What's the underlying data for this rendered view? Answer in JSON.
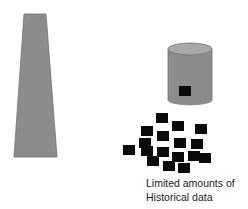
{
  "diagram": {
    "tower": {
      "label": "",
      "color": "#8c8c8c"
    },
    "cylinder": {
      "label": "",
      "body_color": "#8c8c8c",
      "top_color": "#a8a8a8"
    },
    "data_points": {
      "color": "#0a0a0a",
      "squares": [
        {
          "x": 156,
          "y": 113
        },
        {
          "x": 172,
          "y": 121
        },
        {
          "x": 195,
          "y": 124
        },
        {
          "x": 141,
          "y": 126
        },
        {
          "x": 157,
          "y": 131
        },
        {
          "x": 174,
          "y": 138
        },
        {
          "x": 191,
          "y": 139
        },
        {
          "x": 139,
          "y": 138
        },
        {
          "x": 123,
          "y": 145
        },
        {
          "x": 141,
          "y": 146
        },
        {
          "x": 157,
          "y": 147
        },
        {
          "x": 172,
          "y": 152
        },
        {
          "x": 188,
          "y": 151
        },
        {
          "x": 199,
          "y": 153
        },
        {
          "x": 147,
          "y": 156
        },
        {
          "x": 163,
          "y": 161
        },
        {
          "x": 178,
          "y": 163
        }
      ]
    },
    "caption": {
      "line1": "Limited amounts of",
      "line2": "Historical data"
    }
  }
}
